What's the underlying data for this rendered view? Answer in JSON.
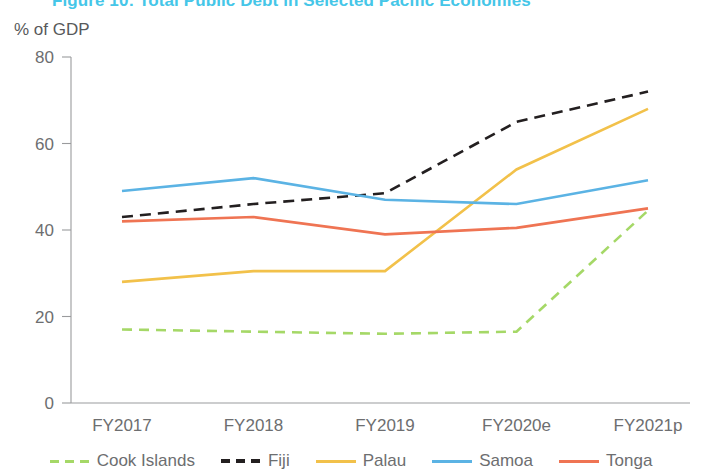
{
  "figure": {
    "title": "Figure 10: Total Public Debt in Selected Pacific Economies",
    "title_color": "#45c6e8",
    "axis_unit_label": "% of GDP"
  },
  "legend": {
    "position": "bottom",
    "items": [
      {
        "label": "Cook Islands",
        "color": "#a2d champion",
        "style": "dashed"
      },
      {
        "label": "Fiji",
        "style": "dashed"
      },
      {
        "label": "Palau",
        "style": "solid"
      },
      {
        "label": "Samoa",
        "style": "solid"
      },
      {
        "label": "Tonga",
        "style": "solid"
      }
    ]
  },
  "chart_data": {
    "type": "line",
    "title": "Figure 10: Total Public Debt in Selected Pacific Economies",
    "subtitle": "",
    "xlabel": "",
    "ylabel": "% of GDP",
    "ylim": [
      0,
      80
    ],
    "yticks": [
      0,
      20,
      40,
      60,
      80
    ],
    "grid": false,
    "legend_position": "bottom",
    "categories": [
      "FY2017",
      "FY2018",
      "FY2019",
      "FY2020e",
      "FY2021p"
    ],
    "series": [
      {
        "name": "Cook Islands",
        "color": "#a5d867",
        "dash": "dashed",
        "values": [
          17,
          16.5,
          16,
          16.5,
          44.5
        ]
      },
      {
        "name": "Fiji",
        "color": "#231f20",
        "dash": "dashed",
        "values": [
          43,
          46,
          48.5,
          65,
          72
        ]
      },
      {
        "name": "Palau",
        "color": "#f2c14a",
        "dash": "solid",
        "values": [
          28,
          30.5,
          30.5,
          54,
          68
        ]
      },
      {
        "name": "Samoa",
        "color": "#5bb3e4",
        "dash": "solid",
        "values": [
          49,
          52,
          47,
          46,
          51.5
        ]
      },
      {
        "name": "Tonga",
        "color": "#ef7453",
        "dash": "solid",
        "values": [
          42,
          43,
          39,
          40.5,
          45
        ]
      }
    ]
  }
}
